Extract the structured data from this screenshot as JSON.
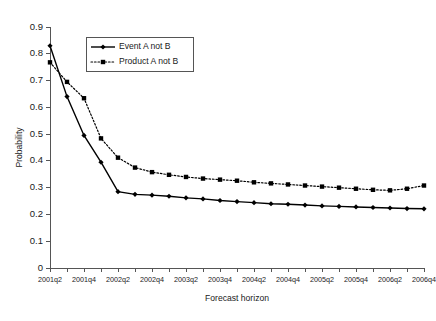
{
  "chart_data": {
    "type": "line",
    "title": "",
    "xlabel": "Forecast horizon",
    "ylabel": "Probability",
    "ylim": [
      0,
      0.9
    ],
    "ytick_labels": [
      "0",
      "0.1",
      "0.2",
      "0.3",
      "0.4",
      "0.5",
      "0.6",
      "0.7",
      "0.8",
      "0.9"
    ],
    "ytick_values": [
      0,
      0.1,
      0.2,
      0.3,
      0.4,
      0.5,
      0.6,
      0.7,
      0.8,
      0.9
    ],
    "grid": false,
    "legend_position": "upper-left-inside",
    "categories": [
      "2001q2",
      "2001q3",
      "2001q4",
      "2002q1",
      "2002q2",
      "2002q3",
      "2002q4",
      "2003q1",
      "2003q2",
      "2003q3",
      "2003q4",
      "2004q1",
      "2004q2",
      "2004q3",
      "2004q4",
      "2005q1",
      "2005q2",
      "2005q3",
      "2005q4",
      "2006q1",
      "2006q2",
      "2006q3",
      "2006q4"
    ],
    "xtick_labels_shown": [
      "2001q2",
      "2001q4",
      "2002q2",
      "2002q4",
      "2003q2",
      "2003q4",
      "2004q2",
      "2004q4",
      "2005q2",
      "2005q4",
      "2006q2",
      "2006q4"
    ],
    "series": [
      {
        "name": "Event A not B",
        "marker": "diamond",
        "line_style": "solid",
        "color": "#000000",
        "values": [
          0.83,
          0.64,
          0.495,
          0.395,
          0.285,
          0.275,
          0.272,
          0.268,
          0.262,
          0.258,
          0.252,
          0.248,
          0.244,
          0.24,
          0.238,
          0.235,
          0.232,
          0.23,
          0.228,
          0.226,
          0.224,
          0.222,
          0.221
        ]
      },
      {
        "name": "Product A not B",
        "marker": "square",
        "line_style": "dotted",
        "color": "#000000",
        "values": [
          0.768,
          0.695,
          0.634,
          0.484,
          0.412,
          0.375,
          0.358,
          0.348,
          0.34,
          0.334,
          0.33,
          0.326,
          0.32,
          0.316,
          0.312,
          0.308,
          0.304,
          0.3,
          0.296,
          0.292,
          0.29,
          0.296,
          0.308
        ]
      }
    ]
  },
  "legend": {
    "entries": [
      {
        "label": "Event A not B"
      },
      {
        "label": "Product A not B"
      }
    ]
  },
  "axes": {
    "y_title": "Probability",
    "x_title": "Forecast horizon"
  }
}
